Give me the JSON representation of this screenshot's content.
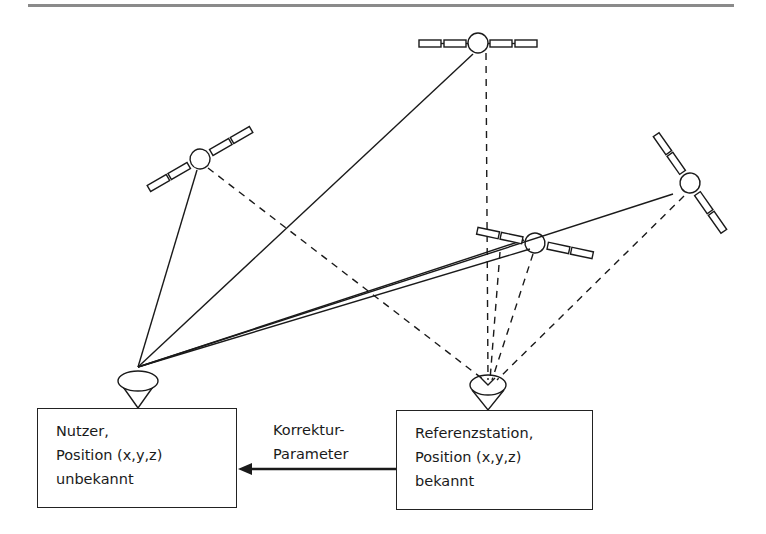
{
  "diagram": {
    "type": "DGPS principle",
    "satellites": [
      {
        "id": "sat-top",
        "cx": 478,
        "cy": 44
      },
      {
        "id": "sat-left",
        "cx": 200,
        "cy": 159
      },
      {
        "id": "sat-right",
        "cx": 690,
        "cy": 183
      },
      {
        "id": "sat-middle",
        "cx": 535,
        "cy": 243
      }
    ],
    "user_box": {
      "lines": [
        "Nutzer,",
        "Position (x,y,z)",
        "unbekannt"
      ]
    },
    "reference_box": {
      "lines": [
        "Referenzstation,",
        "Position (x,y,z)",
        "bekannt"
      ]
    },
    "arrow_label": {
      "lines": [
        "Korrektur-",
        "Parameter"
      ]
    },
    "colors": {
      "line": "#1a1a1a",
      "rule": "#8a8a8a",
      "background": "#ffffff"
    }
  }
}
